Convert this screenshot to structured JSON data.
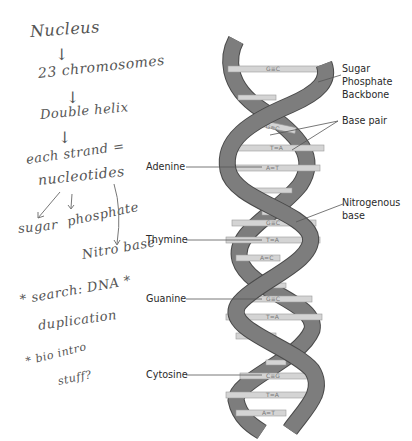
{
  "notes": {
    "lines": [
      {
        "text": "Nucleus"
      },
      {
        "text": "↓"
      },
      {
        "text": "23 chromosomes"
      },
      {
        "text": "↓"
      },
      {
        "text": "Double helix"
      },
      {
        "text": "↓"
      },
      {
        "text": "each strand ="
      },
      {
        "text": "nucleotides"
      },
      {
        "text": "sugar"
      },
      {
        "text": "phosphate"
      },
      {
        "text": "Nitro base"
      },
      {
        "text": "* search: DNA *"
      },
      {
        "text": "duplication"
      },
      {
        "text": "* bio intro"
      },
      {
        "text": "stuff?"
      }
    ]
  },
  "diagram": {
    "labels": {
      "backbone": [
        "Sugar",
        "Phosphate",
        "Backbone"
      ],
      "base_pair": "Base pair",
      "nitrogenous_base": [
        "Nitrogenous",
        "base"
      ],
      "adenine": "Adenine",
      "thymine": "Thymine",
      "guanine": "Guanine",
      "cytosine": "Cytosine"
    },
    "base_pairs": [
      "G≡C",
      "G≡C",
      "T=A",
      "A=T",
      "G≡C",
      "T=A",
      "A=C",
      "G≡C",
      "T=A",
      "A=C",
      "C≡G",
      "T=A",
      "A=T"
    ],
    "colors": {
      "ribbon": "#7d7d7d",
      "ribbon_edge": "#4a4a4a",
      "rung": "#d4d4d4",
      "rung_edge": "#9a9a9a",
      "leader": "#555555"
    }
  }
}
